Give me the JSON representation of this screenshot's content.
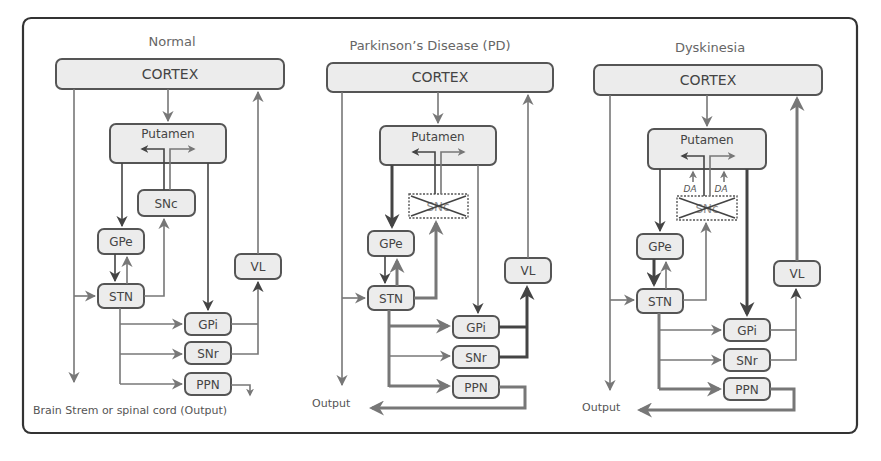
{
  "figure": {
    "panels": [
      {
        "id": "normal",
        "title": "Normal",
        "nodes": {
          "cortex": "CORTEX",
          "putamen": "Putamen",
          "snc": "SNc",
          "gpe": "GPe",
          "stn": "STN",
          "vl": "VL",
          "gpi": "GPi",
          "snr": "SNr",
          "ppn": "PPN"
        },
        "output_label": "Brain Strem or spinal cord (Output)",
        "snc_state": "intact",
        "da_labels": []
      },
      {
        "id": "parkinsons",
        "title": "Parkinson’s Disease (PD)",
        "nodes": {
          "cortex": "CORTEX",
          "putamen": "Putamen",
          "snc": "SNc",
          "gpe": "GPe",
          "stn": "STN",
          "vl": "VL",
          "gpi": "GPi",
          "snr": "SNr",
          "ppn": "PPN"
        },
        "output_label": "Output",
        "snc_state": "degenerated (crossed out)",
        "da_labels": []
      },
      {
        "id": "dyskinesia",
        "title": "Dyskinesia",
        "nodes": {
          "cortex": "CORTEX",
          "putamen": "Putamen",
          "snc": "SNc",
          "gpe": "GPe",
          "stn": "STN",
          "vl": "VL",
          "gpi": "GPi",
          "snr": "SNr",
          "ppn": "PPN"
        },
        "output_label": "Output",
        "snc_state": "degenerated (crossed out)",
        "da_labels": [
          "DA",
          "DA"
        ]
      }
    ],
    "colors": {
      "frame": "#333333",
      "box_fill": "#ececec",
      "box_stroke": "#555555",
      "arrow_gray": "#777777",
      "arrow_dark": "#444444",
      "text": "#555555"
    }
  }
}
